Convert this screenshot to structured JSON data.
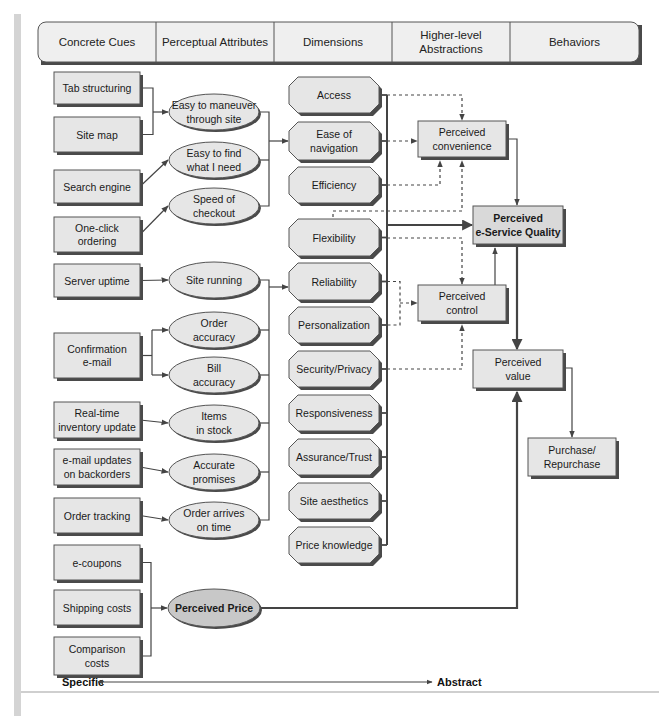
{
  "header": {
    "columns": [
      {
        "label": [
          "Concrete Cues"
        ]
      },
      {
        "label": [
          "Perceptual Attributes"
        ]
      },
      {
        "label": [
          "Dimensions"
        ]
      },
      {
        "label": [
          "Higher-level",
          "Abstractions"
        ]
      },
      {
        "label": [
          "Behaviors"
        ]
      }
    ]
  },
  "concrete_cues": [
    {
      "id": "tab",
      "label": [
        "Tab structuring"
      ]
    },
    {
      "id": "sitemap",
      "label": [
        "Site map"
      ]
    },
    {
      "id": "search",
      "label": [
        "Search engine"
      ]
    },
    {
      "id": "oneclick",
      "label": [
        "One-click",
        "ordering"
      ]
    },
    {
      "id": "uptime",
      "label": [
        "Server uptime"
      ]
    },
    {
      "id": "confirm",
      "label": [
        "Confirmation",
        "e-mail"
      ]
    },
    {
      "id": "inventory",
      "label": [
        "Real-time",
        "inventory update"
      ]
    },
    {
      "id": "backorder",
      "label": [
        "e-mail updates",
        "on backorders"
      ]
    },
    {
      "id": "tracking",
      "label": [
        "Order tracking"
      ]
    },
    {
      "id": "coupons",
      "label": [
        "e-coupons"
      ]
    },
    {
      "id": "shipping",
      "label": [
        "Shipping costs"
      ]
    },
    {
      "id": "comparison",
      "label": [
        "Comparison",
        "costs"
      ]
    }
  ],
  "perceptual_attributes": [
    {
      "id": "maneuver",
      "label": [
        "Easy to maneuver",
        "through site"
      ]
    },
    {
      "id": "find",
      "label": [
        "Easy to find",
        "what I need"
      ]
    },
    {
      "id": "speed",
      "label": [
        "Speed of",
        "checkout"
      ]
    },
    {
      "id": "running",
      "label": [
        "Site running"
      ]
    },
    {
      "id": "orderacc",
      "label": [
        "Order",
        "accuracy"
      ]
    },
    {
      "id": "billacc",
      "label": [
        "Bill",
        "accuracy"
      ]
    },
    {
      "id": "stock",
      "label": [
        "Items",
        "in stock"
      ]
    },
    {
      "id": "promises",
      "label": [
        "Accurate",
        "promises"
      ]
    },
    {
      "id": "ontime",
      "label": [
        "Order arrives",
        "on time"
      ]
    },
    {
      "id": "price",
      "label": [
        "Perceived Price"
      ]
    }
  ],
  "dimensions": [
    {
      "id": "access",
      "label": [
        "Access"
      ]
    },
    {
      "id": "ease",
      "label": [
        "Ease of",
        "navigation"
      ]
    },
    {
      "id": "efficiency",
      "label": [
        "Efficiency"
      ]
    },
    {
      "id": "flexibility",
      "label": [
        "Flexibility"
      ]
    },
    {
      "id": "reliability",
      "label": [
        "Reliability"
      ]
    },
    {
      "id": "personalization",
      "label": [
        "Personalization"
      ]
    },
    {
      "id": "security",
      "label": [
        "Security/Privacy"
      ]
    },
    {
      "id": "responsiveness",
      "label": [
        "Responsiveness"
      ]
    },
    {
      "id": "assurance",
      "label": [
        "Assurance/Trust"
      ]
    },
    {
      "id": "aesthetics",
      "label": [
        "Site aesthetics"
      ]
    },
    {
      "id": "priceknow",
      "label": [
        "Price knowledge"
      ]
    }
  ],
  "abstractions": [
    {
      "id": "convenience",
      "label": [
        "Perceived",
        "convenience"
      ]
    },
    {
      "id": "quality",
      "label": [
        "Perceived",
        "e-Service Quality"
      ]
    },
    {
      "id": "control",
      "label": [
        "Perceived",
        "control"
      ]
    },
    {
      "id": "value",
      "label": [
        "Perceived",
        "value"
      ]
    }
  ],
  "behaviors": [
    {
      "id": "purchase",
      "label": [
        "Purchase/",
        "Repurchase"
      ]
    }
  ],
  "axis": {
    "left_label": "Specific",
    "right_label": "Abstract"
  },
  "colors": {
    "box_fill": "#e6e6e6",
    "box_stroke": "#555555",
    "shadow": "#4a4a4a",
    "price_ellipse_fill": "#c8c8c8",
    "quality_fill": "#d9d9d9",
    "line": "#444444",
    "left_bar": "#d4d4d4"
  }
}
